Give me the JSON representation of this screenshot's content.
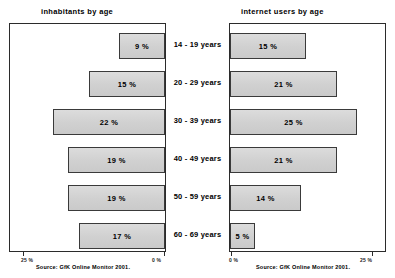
{
  "chart_data": {
    "type": "bar",
    "layout": "butterfly-back-to-back",
    "categories": [
      "14 - 19 years",
      "20 - 29 years",
      "30 - 39 years",
      "40 - 49 years",
      "50 - 59 years",
      "60 - 69 years"
    ],
    "series": [
      {
        "name": "inhabitants by age",
        "direction": "left",
        "values": [
          9,
          15,
          22,
          19,
          19,
          17
        ],
        "labels": [
          "9 %",
          "15 %",
          "22 %",
          "19 %",
          "19 %",
          "17 %"
        ],
        "axis": {
          "ticks": [
            25,
            0
          ],
          "tick_labels": [
            "25 %",
            "0 %"
          ],
          "range": [
            25,
            0
          ],
          "reversed": true
        },
        "source": "Source: GfK Online Monitor 2001."
      },
      {
        "name": "internet users by age",
        "direction": "right",
        "values": [
          15,
          21,
          25,
          21,
          14,
          5
        ],
        "labels": [
          "15 %",
          "21 %",
          "25 %",
          "21 %",
          "14 %",
          "5 %"
        ],
        "axis": {
          "ticks": [
            0,
            25
          ],
          "tick_labels": [
            "0 %",
            "25 %"
          ],
          "range": [
            0,
            25
          ],
          "reversed": false
        },
        "source": "Source: GfK Online Monitor 2001."
      }
    ],
    "title": "",
    "xlabel": "",
    "ylabel": "",
    "grid": false,
    "legend": "none",
    "bar_fill_color": "#d4d4d4",
    "bar_border_color": "#3a3a3a",
    "frame_color": "#2b2b2b"
  },
  "panels": {
    "left": {
      "title": "inhabitants by age",
      "source": "Source: GfK Online Monitor 2001.",
      "tick_left": "25 %",
      "tick_right": "0 %"
    },
    "right": {
      "title": "internet users by age",
      "source": "Source: GfK Online Monitor 2001.",
      "tick_left": "0 %",
      "tick_right": "25 %"
    }
  },
  "top_sliver": {
    "text": ""
  }
}
